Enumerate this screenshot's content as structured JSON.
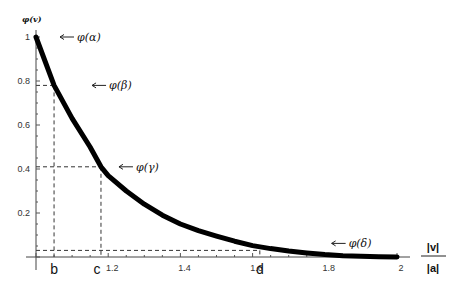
{
  "chart_data": {
    "type": "line",
    "title": "",
    "ylabel": "φ(v)",
    "xlabel_numerator": "|v|",
    "xlabel_denominator": "|a|",
    "xlim": [
      1,
      2
    ],
    "ylim": [
      0,
      1
    ],
    "grid": false,
    "x_ticks": [
      1.2,
      1.4,
      1.6,
      1.8,
      2
    ],
    "x_tick_labels": [
      "1.2",
      "1.4",
      "1.6",
      "1.8",
      "2"
    ],
    "y_ticks": [
      0.2,
      0.4,
      0.6,
      0.8,
      1
    ],
    "y_tick_labels": [
      "0.2",
      "0.4",
      "0.6",
      "0.8",
      "1"
    ],
    "series": [
      {
        "name": "φ(v)",
        "x": [
          1.0,
          1.05,
          1.1,
          1.15,
          1.18,
          1.2,
          1.25,
          1.3,
          1.35,
          1.4,
          1.45,
          1.5,
          1.55,
          1.6,
          1.65,
          1.7,
          1.75,
          1.8,
          1.85,
          1.9,
          1.95,
          2.0
        ],
        "y": [
          1.0,
          0.78,
          0.63,
          0.5,
          0.41,
          0.37,
          0.3,
          0.24,
          0.19,
          0.15,
          0.12,
          0.095,
          0.072,
          0.052,
          0.038,
          0.027,
          0.018,
          0.011,
          0.006,
          0.003,
          0.001,
          0.0
        ]
      }
    ],
    "annotations": [
      {
        "label": "φ(α)",
        "x": 1.0,
        "y": 1.0
      },
      {
        "label": "φ(β)",
        "x": 1.05,
        "y": 0.78
      },
      {
        "label": "φ(γ)",
        "x": 1.18,
        "y": 0.41
      },
      {
        "label": "φ(δ)",
        "x": 1.83,
        "y": 0.03
      }
    ],
    "markers": [
      {
        "label": "b",
        "x": 1.05,
        "y": 0.78
      },
      {
        "label": "c",
        "x": 1.18,
        "y": 0.41
      },
      {
        "label": "d",
        "x": 1.62,
        "y": 0.03
      }
    ]
  }
}
